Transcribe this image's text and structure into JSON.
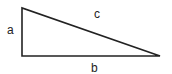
{
  "diagram": {
    "type": "right-triangle",
    "labels": {
      "a": "a",
      "b": "b",
      "c": "c"
    },
    "stroke_color": "#222222",
    "background": "#ffffff"
  }
}
